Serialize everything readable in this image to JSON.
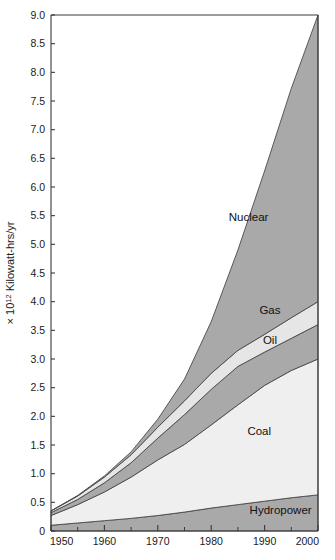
{
  "figure": {
    "title": "",
    "y_axis_label_prefix": "× 10",
    "y_axis_label_exponent": "12",
    "y_axis_label_suffix": " Kilowatt-hrs/yr"
  },
  "chart_data": {
    "type": "area",
    "stacked": true,
    "title": "",
    "xlabel": "",
    "ylabel": "× 10¹² Kilowatt-hrs/yr",
    "xlim": [
      1950,
      2000
    ],
    "ylim": [
      0,
      9.0
    ],
    "grid": false,
    "legend": "inline-band-labels",
    "x_major_ticks": [
      1950,
      1960,
      1970,
      1980,
      1990,
      2000
    ],
    "x_major_tick_labels": [
      "1950",
      "1960",
      "1970",
      "1980",
      "1990",
      "2000"
    ],
    "x_minor_ticks": [
      1955,
      1965,
      1975,
      1985,
      1995
    ],
    "y_major_ticks": [
      0,
      0.5,
      1.0,
      1.5,
      2.0,
      2.5,
      3.0,
      3.5,
      4.0,
      4.5,
      5.0,
      5.5,
      6.0,
      6.5,
      7.0,
      7.5,
      8.0,
      8.5,
      9.0
    ],
    "y_major_tick_labels": [
      "0",
      "0.5",
      "1.0",
      "1.5",
      "2.0",
      "2.5",
      "3.0",
      "3.5",
      "4.0",
      "4.5",
      "5.0",
      "5.5",
      "6.0",
      "6.5",
      "7.0",
      "7.5",
      "8.0",
      "8.5",
      "9.0"
    ],
    "x": [
      1950,
      1955,
      1960,
      1965,
      1970,
      1975,
      1980,
      1985,
      1990,
      1995,
      2000
    ],
    "series": [
      {
        "name": "Hydropower",
        "color": "#a9a9a9",
        "label": "Hydropower",
        "values": [
          0.1,
          0.14,
          0.18,
          0.22,
          0.27,
          0.33,
          0.4,
          0.46,
          0.52,
          0.58,
          0.63
        ]
      },
      {
        "name": "Coal",
        "color": "#efefef",
        "label": "Coal",
        "values": [
          0.17,
          0.32,
          0.5,
          0.72,
          0.97,
          1.18,
          1.45,
          1.74,
          2.02,
          2.22,
          2.37
        ]
      },
      {
        "name": "Oil",
        "color": "#a9a9a9",
        "label": "Oil",
        "values": [
          0.05,
          0.09,
          0.16,
          0.25,
          0.38,
          0.52,
          0.62,
          0.67,
          0.58,
          0.56,
          0.6
        ]
      },
      {
        "name": "Gas",
        "color": "#e6e6e6",
        "label": "Gas",
        "values": [
          0.03,
          0.06,
          0.1,
          0.14,
          0.19,
          0.24,
          0.28,
          0.28,
          0.31,
          0.36,
          0.4
        ]
      },
      {
        "name": "Nuclear",
        "color": "#a9a9a9",
        "label": "Nuclear",
        "values": [
          0.0,
          0.01,
          0.02,
          0.05,
          0.14,
          0.38,
          0.9,
          1.75,
          2.85,
          4.0,
          5.0
        ]
      }
    ],
    "totals": [
      0.35,
      0.62,
      0.96,
      1.38,
      1.95,
      2.65,
      3.65,
      4.9,
      6.28,
      7.72,
      9.0
    ],
    "band_label_positions": [
      {
        "label": "Nuclear",
        "x": 1987,
        "y": 5.4
      },
      {
        "label": "Gas",
        "x": 1991,
        "y": 3.78
      },
      {
        "label": "Oil",
        "x": 1991,
        "y": 3.27
      },
      {
        "label": "Coal",
        "x": 1989,
        "y": 1.68
      },
      {
        "label": "Hydropower",
        "x": 1993,
        "y": 0.3
      }
    ]
  }
}
